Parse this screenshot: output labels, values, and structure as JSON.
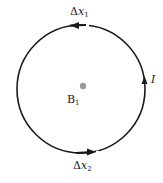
{
  "diagram": {
    "type": "current-loop",
    "loop": {
      "center": [
        81,
        87
      ],
      "radius": 64,
      "stroke": "#1a1a1a"
    },
    "center_point": {
      "position": [
        83,
        86
      ],
      "color": "#9a9a9a"
    },
    "labels": {
      "dx1": {
        "main": "Δ",
        "var": "x",
        "sub": "1"
      },
      "dx2": {
        "main": "Δ",
        "var": "x",
        "sub": "2"
      },
      "current": "I",
      "field": {
        "main": "B",
        "sub": "1"
      }
    },
    "arrows": [
      {
        "name": "dx1-arrow",
        "direction": "left",
        "position": "top"
      },
      {
        "name": "current-arrow",
        "direction": "up",
        "position": "right"
      },
      {
        "name": "dx2-arrow",
        "direction": "right",
        "position": "bottom"
      }
    ]
  }
}
